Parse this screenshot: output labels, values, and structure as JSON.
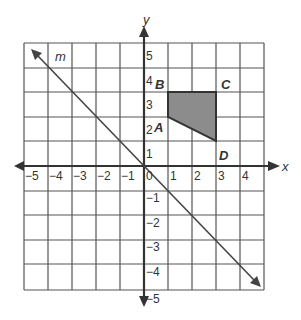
{
  "diagram": {
    "type": "coordinate-plane",
    "x_axis_label": "x",
    "y_axis_label": "y",
    "x_range": [
      -5,
      5
    ],
    "y_range": [
      -5,
      5
    ],
    "x_tick_labels": [
      "−5",
      "−4",
      "−3",
      "−2",
      "−1",
      "0",
      "1",
      "2",
      "3",
      "4"
    ],
    "y_tick_labels_positive": [
      "5",
      "4",
      "3",
      "2",
      "1"
    ],
    "y_tick_labels_negative": [
      "−1",
      "−2",
      "−3",
      "−4",
      "−5"
    ],
    "line": {
      "label": "m",
      "through": [
        [
          -4,
          4
        ],
        [
          4,
          -4
        ]
      ],
      "slope": -1
    },
    "polygon": {
      "fill": "#8c8c8c",
      "vertices": [
        {
          "label": "A",
          "x": 1,
          "y": 2
        },
        {
          "label": "B",
          "x": 1,
          "y": 3
        },
        {
          "label": "C",
          "x": 3,
          "y": 3
        },
        {
          "label": "D",
          "x": 3,
          "y": 1
        }
      ]
    }
  }
}
